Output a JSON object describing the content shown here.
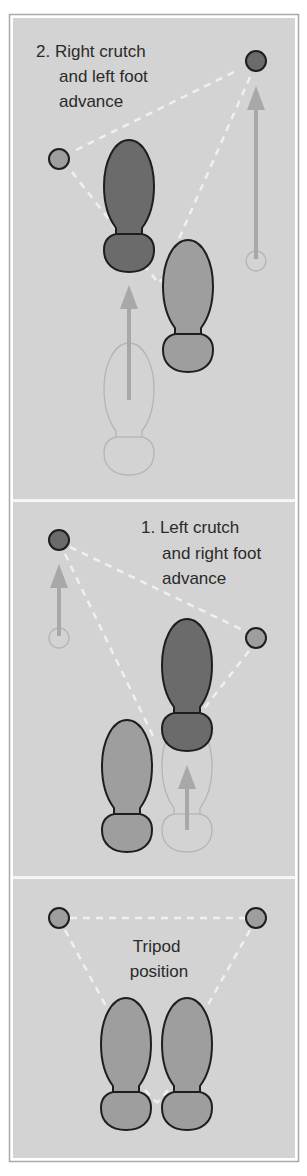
{
  "colors": {
    "panel_bg": "#d3d3d3",
    "frame": "#a9a9a9",
    "divider": "#f4f4f4",
    "dark_fill": "#6b6b6b",
    "light_fill": "#9e9e9e",
    "outline": "#1e1e1e",
    "ghost_outline": "#b5b5b5",
    "arrow": "#a8a8a8",
    "dash": "#f0f0f0"
  },
  "panels": [
    {
      "id": "step-2",
      "label_lines": [
        "2. Right crutch",
        "and left foot",
        "advance"
      ]
    },
    {
      "id": "step-1",
      "label_lines": [
        "1. Left crutch",
        "and right foot",
        "advance"
      ]
    },
    {
      "id": "tripod",
      "label_lines": [
        "Tripod",
        "position"
      ]
    }
  ],
  "legend_semantics": {
    "dark_shape": "limb/crutch being advanced (new position)",
    "light_shape": "stationary limb/crutch",
    "ghost_outline": "previous position",
    "arrow": "direction of advance",
    "dashed_lines": "base of support triangle"
  }
}
